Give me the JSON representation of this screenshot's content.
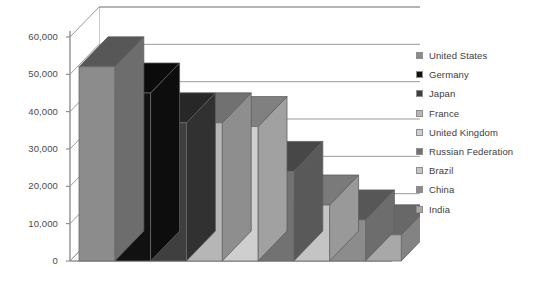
{
  "title_partial": "",
  "axis": {
    "y_ticks": [
      "60,000",
      "50,000",
      "40,000",
      "30,000",
      "20,000",
      "10,000",
      "0"
    ]
  },
  "legend": {
    "items": [
      {
        "label": "United States",
        "color": "#8c8c8c"
      },
      {
        "label": "Germany",
        "color": "#111111"
      },
      {
        "label": "Japan",
        "color": "#3f3f3f"
      },
      {
        "label": "France",
        "color": "#b6b6b6"
      },
      {
        "label": "United Kingdom",
        "color": "#cfcfcf"
      },
      {
        "label": "Russian Federation",
        "color": "#727272"
      },
      {
        "label": "Brazil",
        "color": "#c4c4c4"
      },
      {
        "label": "China",
        "color": "#8c8c8c"
      },
      {
        "label": "India",
        "color": "#a8a8a8"
      }
    ]
  },
  "chart_data": {
    "type": "bar",
    "title": "",
    "xlabel": "",
    "ylabel": "",
    "ylim": [
      0,
      60000
    ],
    "ytick_values": [
      0,
      10000,
      20000,
      30000,
      40000,
      50000,
      60000
    ],
    "grid": true,
    "legend_position": "right",
    "three_d": true,
    "categories": [
      "United States",
      "Germany",
      "Japan",
      "France",
      "United Kingdom",
      "Russian Federation",
      "Brazil",
      "China",
      "India"
    ],
    "values": [
      52000,
      45000,
      37000,
      37000,
      36000,
      24000,
      15000,
      11000,
      7000
    ],
    "colors": [
      "#8c8c8c",
      "#111111",
      "#3f3f3f",
      "#b6b6b6",
      "#cfcfcf",
      "#727272",
      "#c4c4c4",
      "#8c8c8c",
      "#a8a8a8"
    ]
  }
}
